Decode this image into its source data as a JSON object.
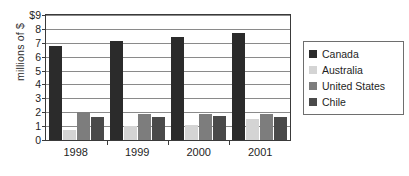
{
  "chart_data": {
    "type": "bar",
    "title": "",
    "xlabel": "",
    "ylabel": "millions of $",
    "categories": [
      "1998",
      "1999",
      "2000",
      "2001"
    ],
    "series": [
      {
        "name": "Canada",
        "color": "#2b2b2b",
        "values": [
          6.75,
          7.1,
          7.45,
          7.7
        ]
      },
      {
        "name": "Australia",
        "color": "#d4d4d4",
        "values": [
          0.7,
          1.0,
          1.05,
          1.5
        ]
      },
      {
        "name": "United States",
        "color": "#7d7d7d",
        "values": [
          2.0,
          1.9,
          1.85,
          1.9
        ]
      },
      {
        "name": "Chile",
        "color": "#4a4a4a",
        "values": [
          1.65,
          1.65,
          1.75,
          1.65
        ]
      }
    ],
    "ylim": [
      0,
      9
    ],
    "yticks": [
      0,
      1,
      2,
      3,
      4,
      5,
      6,
      7,
      8,
      9
    ],
    "ytick_labels": [
      "0",
      "1",
      "2",
      "3",
      "4",
      "5",
      "6",
      "7",
      "8",
      "$9"
    ],
    "grid": true,
    "legend_position": "right"
  }
}
